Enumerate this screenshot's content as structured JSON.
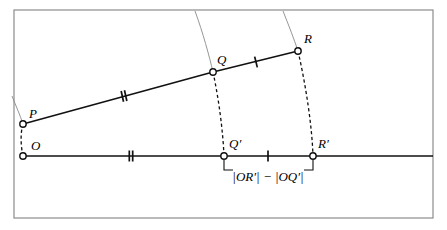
{
  "figure": {
    "background_color": "#ffffff",
    "frame": {
      "color": "#8c8c8c",
      "x": 14,
      "y": 10,
      "width": 419,
      "height": 208,
      "stroke_width": 1.2
    },
    "colors": {
      "line": "#111111",
      "arc_guide": "#8a8a8a",
      "dashed": "#111111",
      "marker_fill": "#ffffff",
      "marker_stroke": "#111111",
      "text": "#000000"
    }
  },
  "points": [
    {
      "id": "P",
      "label": "P",
      "x": 23,
      "y": 124,
      "label_dx": 6,
      "label_dy": -6,
      "radius": 3.2
    },
    {
      "id": "O",
      "label": "O",
      "x": 23,
      "y": 156,
      "label_dx": 8,
      "label_dy": -6,
      "radius": 3.2
    },
    {
      "id": "Q",
      "label": "Q",
      "x": 213,
      "y": 72,
      "label_dx": 4,
      "label_dy": -8,
      "radius": 3.2
    },
    {
      "id": "R",
      "label": "R",
      "x": 298,
      "y": 51,
      "label_dx": 6,
      "label_dy": -8,
      "radius": 3.2
    },
    {
      "id": "Qp",
      "label": "Q′",
      "x": 224,
      "y": 156,
      "label_dx": 5,
      "label_dy": -8,
      "radius": 3.2
    },
    {
      "id": "Rp",
      "label": "R′",
      "x": 313,
      "y": 156,
      "label_dx": 5,
      "label_dy": -8,
      "radius": 3.2
    }
  ],
  "segments": [
    {
      "name": "segment-PQ",
      "from": "P",
      "to": "Q",
      "style": "solid",
      "width": 1.6
    },
    {
      "name": "segment-QR",
      "from": "Q",
      "to": "R",
      "style": "solid",
      "width": 1.6
    }
  ],
  "baseline": {
    "name": "baseline-ray",
    "x1": 23,
    "x2": 433,
    "y": 156,
    "style": "solid",
    "width": 1.6
  },
  "dashed_arcs": [
    {
      "name": "arc-P-to-O",
      "d": "M 23 124 C 20 134, 21 147, 23 156"
    },
    {
      "name": "arc-Q-to-Qp",
      "d": "M 213 72 C 219 100, 223 132, 224 156"
    },
    {
      "name": "arc-R-to-Rp",
      "d": "M 298 51 C 306 86, 312 126, 313 156"
    }
  ],
  "guide_arcs": [
    {
      "name": "guide-arc-through-P",
      "d": "M 12 96 C 16 106, 20 115, 23 124"
    },
    {
      "name": "guide-arc-through-Q",
      "d": "M 195 11 C 203 33, 209 55, 213 72"
    },
    {
      "name": "guide-arc-through-R",
      "d": "M 283 11 C 289 26, 294 39, 298 51"
    }
  ],
  "tick_marks": [
    {
      "name": "tick-double-PQ",
      "x": 124,
      "y": 96,
      "count": 2,
      "angle": -12.5,
      "length": 11
    },
    {
      "name": "tick-single-QR",
      "x": 256,
      "y": 62,
      "count": 1,
      "angle": -14,
      "length": 11
    },
    {
      "name": "tick-double-OQp",
      "x": 131,
      "y": 156,
      "count": 2,
      "angle": 0,
      "length": 11
    },
    {
      "name": "tick-single-QpRp",
      "x": 268,
      "y": 156,
      "count": 1,
      "angle": 0,
      "length": 11
    }
  ],
  "measure_bracket": {
    "name": "difference-bracket",
    "x1": 224,
    "x2": 313,
    "y_top": 160,
    "y_bottom": 170,
    "label": "|OR′| − |OQ′|",
    "label_x": 268,
    "label_y": 181,
    "stroke_width": 1.1
  },
  "labels": {
    "P": "P",
    "O": "O",
    "Q": "Q",
    "R": "R",
    "Q_prime": "Q′",
    "R_prime": "R′",
    "difference_expression": "|OR′| − |OQ′|"
  }
}
